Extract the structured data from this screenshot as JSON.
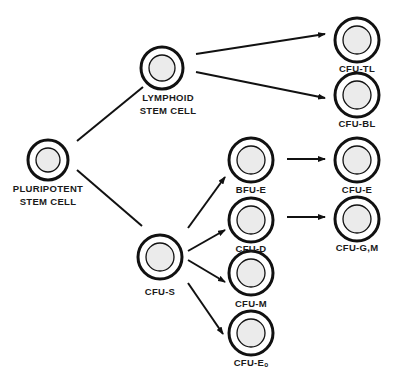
{
  "diagram": {
    "type": "hematopoietic-lineage-tree",
    "colors": {
      "background": "#ffffff",
      "stroke": "#111111",
      "nucleus_fill": "#ebebeb",
      "text": "#1a1a1a"
    },
    "nodes": [
      {
        "id": "pluripotent",
        "label_lines": [
          "PLURIPOTENT",
          "STEM CELL"
        ],
        "cx": 48,
        "cy": 160,
        "r": 20,
        "label_x": 48,
        "label_y": 182
      },
      {
        "id": "lymphoid",
        "label_lines": [
          "LYMPHOID",
          "STEM CELL"
        ],
        "cx": 162,
        "cy": 68,
        "r": 21,
        "label_x": 168,
        "label_y": 91
      },
      {
        "id": "cfu-s",
        "label_lines": [
          "CFU-S"
        ],
        "cx": 160,
        "cy": 257,
        "r": 22,
        "label_x": 160,
        "label_y": 285
      },
      {
        "id": "cfu-tl",
        "label_lines": [
          "CFU-TL"
        ],
        "cx": 357,
        "cy": 40,
        "r": 22,
        "label_x": 357,
        "label_y": 62
      },
      {
        "id": "cfu-bl",
        "label_lines": [
          "CFU-BL"
        ],
        "cx": 357,
        "cy": 95,
        "r": 22,
        "label_x": 357,
        "label_y": 117
      },
      {
        "id": "bfu-e",
        "label_lines": [
          "BFU-E"
        ],
        "cx": 251,
        "cy": 160,
        "r": 22,
        "label_x": 251,
        "label_y": 183
      },
      {
        "id": "cfu-d",
        "label_lines": [
          "CFU-D"
        ],
        "cx": 251,
        "cy": 220,
        "r": 22,
        "label_x": 251,
        "label_y": 242
      },
      {
        "id": "cfu-m",
        "label_lines": [
          "CFU-M"
        ],
        "cx": 251,
        "cy": 273,
        "r": 22,
        "label_x": 251,
        "label_y": 297
      },
      {
        "id": "cfu-eo",
        "label_lines": [
          "CFU-Eₒ"
        ],
        "cx": 251,
        "cy": 333,
        "r": 22,
        "label_x": 251,
        "label_y": 356
      },
      {
        "id": "cfu-e",
        "label_lines": [
          "CFU-E"
        ],
        "cx": 357,
        "cy": 160,
        "r": 22,
        "label_x": 357,
        "label_y": 183
      },
      {
        "id": "cfu-gm",
        "label_lines": [
          "CFU-G,M"
        ],
        "cx": 357,
        "cy": 219,
        "r": 22,
        "label_x": 357,
        "label_y": 241
      }
    ],
    "edges": [
      {
        "from": "pluripotent",
        "to": "lymphoid",
        "x1": 77,
        "y1": 141,
        "x2": 143,
        "y2": 87,
        "arrow": false
      },
      {
        "from": "pluripotent",
        "to": "cfu-s",
        "x1": 77,
        "y1": 170,
        "x2": 142,
        "y2": 226,
        "arrow": false
      },
      {
        "from": "lymphoid",
        "to": "cfu-tl",
        "x1": 196,
        "y1": 54,
        "x2": 325,
        "y2": 34,
        "arrow": true
      },
      {
        "from": "lymphoid",
        "to": "cfu-bl",
        "x1": 196,
        "y1": 72,
        "x2": 325,
        "y2": 98,
        "arrow": true
      },
      {
        "from": "cfu-s",
        "to": "bfu-e",
        "x1": 188,
        "y1": 228,
        "x2": 225,
        "y2": 177,
        "arrow": true
      },
      {
        "from": "cfu-s",
        "to": "cfu-d",
        "x1": 188,
        "y1": 251,
        "x2": 225,
        "y2": 230,
        "arrow": true
      },
      {
        "from": "cfu-s",
        "to": "cfu-m",
        "x1": 188,
        "y1": 260,
        "x2": 225,
        "y2": 282,
        "arrow": true
      },
      {
        "from": "cfu-s",
        "to": "cfu-eo",
        "x1": 188,
        "y1": 283,
        "x2": 223,
        "y2": 334,
        "arrow": true
      },
      {
        "from": "bfu-e",
        "to": "cfu-e",
        "x1": 287,
        "y1": 159,
        "x2": 325,
        "y2": 159,
        "arrow": true
      },
      {
        "from": "cfu-d",
        "to": "cfu-gm",
        "x1": 287,
        "y1": 217,
        "x2": 325,
        "y2": 217,
        "arrow": true
      }
    ]
  }
}
